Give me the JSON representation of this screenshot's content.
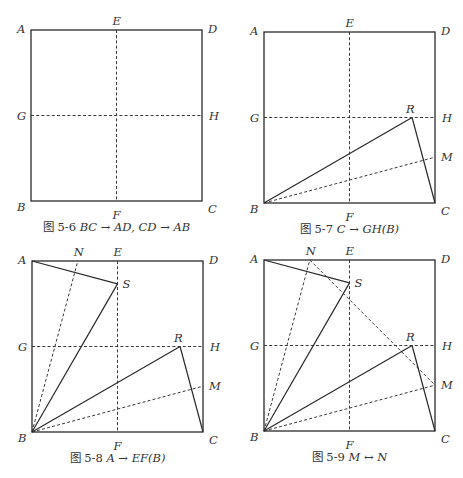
{
  "figures": [
    {
      "id": "fig-5-6",
      "caption_number": "图 5-6",
      "caption_math": "BC → AD, CD → AB",
      "origin": [
        31,
        30
      ],
      "side": 171,
      "labels": [
        "A",
        "B",
        "C",
        "D",
        "E",
        "F",
        "G",
        "H"
      ],
      "solid_segments": [],
      "dashed_segments": [
        [
          "E",
          "F"
        ],
        [
          "G",
          "H"
        ]
      ]
    },
    {
      "id": "fig-5-7",
      "caption_number": "图 5-7",
      "caption_math": "C → GH(B)",
      "origin": [
        264,
        32
      ],
      "side": 171,
      "labels": [
        "A",
        "B",
        "C",
        "D",
        "E",
        "F",
        "G",
        "H",
        "R",
        "M"
      ],
      "solid_segments": [
        [
          "B",
          "R"
        ],
        [
          "R",
          "C"
        ]
      ],
      "dashed_segments": [
        [
          "E",
          "F"
        ],
        [
          "G",
          "H"
        ],
        [
          "B",
          "M"
        ]
      ]
    },
    {
      "id": "fig-5-8",
      "caption_number": "图 5-8",
      "caption_math": "A → EF(B)",
      "origin": [
        32,
        261
      ],
      "side": 171,
      "labels": [
        "A",
        "B",
        "C",
        "D",
        "E",
        "F",
        "G",
        "H",
        "R",
        "M",
        "S",
        "N"
      ],
      "solid_segments": [
        [
          "B",
          "R"
        ],
        [
          "R",
          "C"
        ],
        [
          "A",
          "S"
        ],
        [
          "S",
          "B"
        ]
      ],
      "dashed_segments": [
        [
          "E",
          "F"
        ],
        [
          "G",
          "H"
        ],
        [
          "B",
          "M"
        ],
        [
          "B",
          "N"
        ]
      ]
    },
    {
      "id": "fig-5-9",
      "caption_number": "图 5-9",
      "caption_math": "M ↔ N",
      "origin": [
        264,
        260
      ],
      "side": 171,
      "labels": [
        "A",
        "B",
        "C",
        "D",
        "E",
        "F",
        "G",
        "H",
        "R",
        "M",
        "S",
        "N"
      ],
      "solid_segments": [
        [
          "B",
          "R"
        ],
        [
          "R",
          "C"
        ],
        [
          "A",
          "S"
        ],
        [
          "S",
          "B"
        ]
      ],
      "dashed_segments": [
        [
          "E",
          "F"
        ],
        [
          "G",
          "H"
        ],
        [
          "B",
          "M"
        ],
        [
          "B",
          "N"
        ],
        [
          "N",
          "M"
        ]
      ]
    }
  ],
  "points_unit": {
    "A": [
      0,
      1
    ],
    "B": [
      0,
      0
    ],
    "C": [
      1,
      0
    ],
    "D": [
      1,
      1
    ],
    "E": [
      0.5,
      1
    ],
    "F": [
      0.5,
      0
    ],
    "G": [
      0,
      0.5
    ],
    "H": [
      1,
      0.5
    ],
    "R": [
      0.866,
      0.5
    ],
    "M": [
      1,
      0.268
    ],
    "S": [
      0.5,
      0.866
    ],
    "N": [
      0.268,
      1
    ]
  },
  "label_offsets": {
    "A": [
      -14,
      3
    ],
    "B": [
      -14,
      10
    ],
    "C": [
      6,
      12
    ],
    "D": [
      6,
      3
    ],
    "E": [
      -4,
      -5
    ],
    "F": [
      -4,
      18
    ],
    "G": [
      -14,
      4
    ],
    "H": [
      7,
      4
    ],
    "R": [
      -6,
      -5
    ],
    "M": [
      6,
      4
    ],
    "S": [
      5,
      4
    ],
    "N": [
      -4,
      -5
    ]
  }
}
